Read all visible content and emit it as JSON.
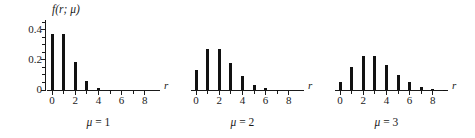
{
  "figure": {
    "background": "#ffffff",
    "ink_color": "#111111",
    "y_axis": {
      "label": "f(r; μ)",
      "tick_labels": [
        "0",
        "0.2",
        "0.4"
      ],
      "tick_values": [
        0,
        0.2,
        0.4
      ],
      "minor_ticks": [
        0.05,
        0.1,
        0.15,
        0.25,
        0.3,
        0.35,
        0.45
      ],
      "range": [
        0,
        0.45
      ]
    },
    "x_axis": {
      "name": "r",
      "tick_labels": [
        "0",
        "2",
        "4",
        "6",
        "8"
      ],
      "tick_values": [
        0,
        2,
        4,
        6,
        8
      ],
      "minor_ticks": [
        1,
        3,
        5,
        7
      ],
      "range": [
        -0.5,
        9.3
      ]
    }
  },
  "chart_data": {
    "type": "bar",
    "title": "",
    "xlabel": "r",
    "ylabel": "f(r; μ)",
    "ylim": [
      0,
      0.45
    ],
    "xlim": [
      -0.5,
      9.3
    ],
    "grid": false,
    "legend": "none",
    "x": [
      0,
      1,
      2,
      3,
      4,
      5,
      6,
      7,
      8,
      9
    ],
    "panels": [
      {
        "caption": "μ = 1",
        "mu_symbol": "μ",
        "mu_equals": "=",
        "mu_value": "1",
        "series_name": "Poisson(1)",
        "values": [
          0.368,
          0.368,
          0.184,
          0.061,
          0.015,
          0.003,
          0.001,
          0.0,
          0.0,
          0.0
        ]
      },
      {
        "caption": "μ = 2",
        "mu_symbol": "μ",
        "mu_equals": "=",
        "mu_value": "2",
        "series_name": "Poisson(2)",
        "values": [
          0.135,
          0.271,
          0.271,
          0.18,
          0.09,
          0.036,
          0.012,
          0.003,
          0.001,
          0.0
        ]
      },
      {
        "caption": "μ = 3",
        "mu_symbol": "μ",
        "mu_equals": "=",
        "mu_value": "3",
        "series_name": "Poisson(3)",
        "values": [
          0.05,
          0.149,
          0.224,
          0.224,
          0.168,
          0.101,
          0.05,
          0.022,
          0.008,
          0.003
        ]
      }
    ]
  }
}
